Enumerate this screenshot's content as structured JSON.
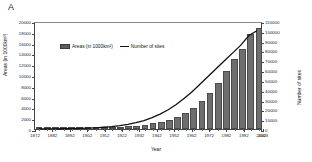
{
  "panel": {
    "label": "A"
  },
  "axes": {
    "xlabel": "Year",
    "ylabel_left": "Areas (in 1000km²)",
    "ylabel_right": "Number of sites"
  },
  "legend": {
    "items": [
      {
        "label": "Areas (in 1000km²)",
        "marker": "bar-swatch",
        "color": "#5d5d5d"
      },
      {
        "label": "Number of sites",
        "marker": "line-swatch",
        "color": "#111111"
      }
    ]
  },
  "chart_data": {
    "type": "bar",
    "title": "",
    "subtitle": "",
    "xlabel": "Year",
    "ylabel": "Areas (in 1000km²)",
    "ylabel_secondary": "Number of sites",
    "xlim": [
      1872,
      2003
    ],
    "ylim": [
      0,
      20000
    ],
    "ylim_secondary": [
      0,
      110000
    ],
    "grid": false,
    "legend_position": "upper-left-inside",
    "yticks": [
      0,
      2000,
      4000,
      6000,
      8000,
      10000,
      12000,
      14000,
      16000,
      18000,
      20000
    ],
    "ytick_labels": [
      "0",
      "2000",
      "4000",
      "6000",
      "8000",
      "10000",
      "12000",
      "14000",
      "16000",
      "18000",
      "20000"
    ],
    "yticks_secondary": [
      0,
      10000,
      20000,
      30000,
      40000,
      50000,
      60000,
      70000,
      80000,
      90000,
      100000,
      110000
    ],
    "ytick_labels_secondary": [
      "0",
      "10000",
      "20000",
      "30000",
      "40000",
      "50000",
      "60000",
      "70000",
      "80000",
      "90000",
      "100000",
      "110000"
    ],
    "xticks": [
      1872,
      1882,
      1892,
      1902,
      1912,
      1922,
      1932,
      1942,
      1952,
      1962,
      1972,
      1982,
      1992,
      2002,
      2003
    ],
    "xtick_labels": [
      "1872",
      "1882",
      "1892",
      "1902",
      "1912",
      "1922",
      "1932",
      "1942",
      "1952",
      "1962",
      "1972",
      "1982",
      "1992",
      "2002",
      "2003"
    ],
    "categories": [
      1872,
      1877,
      1882,
      1887,
      1892,
      1897,
      1902,
      1907,
      1912,
      1917,
      1922,
      1927,
      1932,
      1937,
      1942,
      1947,
      1952,
      1957,
      1962,
      1967,
      1972,
      1977,
      1982,
      1987,
      1992,
      1997,
      2002,
      2003
    ],
    "series": [
      {
        "name": "Areas (in 1000km²)",
        "axis": "left",
        "type": "bar",
        "color": "#6e6e6e",
        "values": [
          10,
          15,
          25,
          40,
          60,
          85,
          120,
          170,
          230,
          300,
          390,
          500,
          640,
          820,
          1050,
          1350,
          1750,
          2250,
          2950,
          3900,
          5100,
          6700,
          8600,
          10700,
          12900,
          14800,
          17600,
          18700
        ]
      },
      {
        "name": "Number of sites",
        "axis": "right",
        "type": "line",
        "color": "#111111",
        "values": [
          50,
          90,
          150,
          240,
          380,
          580,
          850,
          1250,
          1800,
          2500,
          3500,
          4800,
          6500,
          8800,
          11800,
          15500,
          20000,
          25500,
          32000,
          39000,
          47000,
          55000,
          63000,
          71000,
          79000,
          87000,
          97000,
          102000
        ]
      }
    ]
  }
}
